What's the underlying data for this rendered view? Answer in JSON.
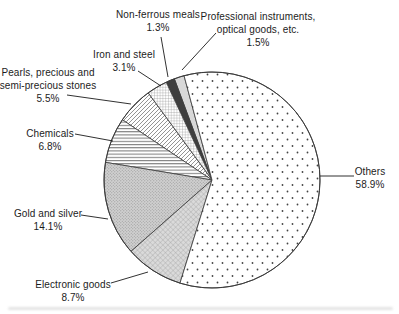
{
  "chart_data": {
    "type": "pie",
    "title": "",
    "unit": "%",
    "layout": {
      "cx": 212,
      "cy": 180,
      "r": 108,
      "start_angle_ccw_from_12": 15,
      "direction": "counterclockwise",
      "outline_color": "#3a3a3a",
      "background": "#ffffff"
    },
    "slices": [
      {
        "id": "professional",
        "label": "Professional instruments, optical goods, etc.",
        "value": 1.5,
        "fill": "#d8d8d8"
      },
      {
        "id": "non-ferrous",
        "label": "Non-ferrous meals",
        "value": 1.3,
        "fill": "#3e3e3e"
      },
      {
        "id": "iron-steel",
        "label": "Iron and steel",
        "value": 3.1,
        "fill": "pattern:grid"
      },
      {
        "id": "pearls",
        "label": "Pearls, precious and semi-precious stones",
        "value": 5.5,
        "fill": "pattern:diag"
      },
      {
        "id": "chemicals",
        "label": "Chemicals",
        "value": 6.8,
        "fill": "pattern:hlines"
      },
      {
        "id": "gold-silver",
        "label": "Gold and silver",
        "value": 14.1,
        "fill": "pattern:stipple"
      },
      {
        "id": "electronic",
        "label": "Electronic goods",
        "value": 8.7,
        "fill": "pattern:halftone2"
      },
      {
        "id": "others",
        "label": "Others",
        "value": 58.9,
        "fill": "pattern:dots"
      }
    ],
    "labels": [
      {
        "id": "non-ferrous",
        "lines": [
          "Non-ferrous meals",
          "1.3%"
        ],
        "x": 158,
        "y": 8,
        "pointer": {
          "x1": 161,
          "y1": 37,
          "x2": 168,
          "y2": 77
        }
      },
      {
        "id": "professional",
        "lines": [
          "Professional instruments,",
          "optical goods, etc.",
          "1.5%"
        ],
        "x": 258,
        "y": 10,
        "pointer": {
          "x1": 216,
          "y1": 33,
          "x2": 182,
          "y2": 70
        }
      },
      {
        "id": "iron-steel",
        "lines": [
          "Iron and steel",
          "3.1%"
        ],
        "x": 124,
        "y": 48,
        "pointer": {
          "x1": 138,
          "y1": 71,
          "x2": 161,
          "y2": 86
        }
      },
      {
        "id": "pearls",
        "lines": [
          "Pearls, precious and",
          "semi-precious stones",
          "5.5%"
        ],
        "x": 48,
        "y": 66,
        "pointer": {
          "x1": 67,
          "y1": 95,
          "x2": 131,
          "y2": 104
        }
      },
      {
        "id": "chemicals",
        "lines": [
          "Chemicals",
          "6.8%"
        ],
        "x": 50,
        "y": 127,
        "pointer": {
          "x1": 75,
          "y1": 134,
          "x2": 113,
          "y2": 141
        }
      },
      {
        "id": "gold-silver",
        "lines": [
          "Gold and silver",
          "14.1%"
        ],
        "x": 48,
        "y": 207,
        "pointer": {
          "x1": 81,
          "y1": 215,
          "x2": 108,
          "y2": 219
        }
      },
      {
        "id": "electronic",
        "lines": [
          "Electronic goods",
          "8.7%"
        ],
        "x": 73,
        "y": 278,
        "pointer": {
          "x1": 111,
          "y1": 283,
          "x2": 148,
          "y2": 272
        }
      },
      {
        "id": "others",
        "lines": [
          "Others",
          "58.9%"
        ],
        "x": 370,
        "y": 165,
        "pointer": {
          "x1": 354,
          "y1": 176,
          "x2": 320,
          "y2": 176
        }
      }
    ],
    "pattern_colors": {
      "dot_color": "#444444",
      "grid_line": "#8a8a8a",
      "diag_line": "#666666",
      "hline": "#3c3c3c",
      "stipple_bg": "#d0d0d0",
      "stipple_dot": "#8f8f8f",
      "halftone2_bg": "#dadada",
      "halftone2_line": "#9d9d9d"
    }
  }
}
